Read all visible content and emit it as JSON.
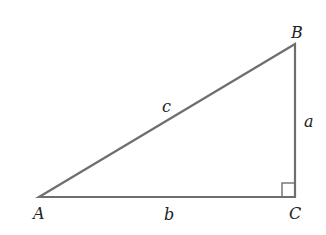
{
  "diagram": {
    "type": "right-triangle",
    "vertices": {
      "A": {
        "label": "A"
      },
      "B": {
        "label": "B"
      },
      "C": {
        "label": "C"
      }
    },
    "sides": {
      "a": {
        "label": "a"
      },
      "b": {
        "label": "b"
      },
      "c": {
        "label": "c"
      }
    },
    "right_angle_at": "C",
    "stroke_color": "#6e6e6e"
  }
}
